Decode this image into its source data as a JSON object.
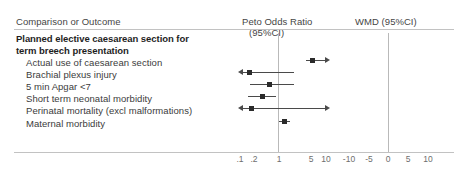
{
  "header": {
    "outcome_col": "Comparison or Outcome",
    "peto_col_line1": "Peto Odds Ratio",
    "peto_col_line2": "(95%CI)",
    "wmd_col": "WMD (95%CI)"
  },
  "group_title_line1": "Planned elective caesarean section for",
  "group_title_line2": "term breech presentation",
  "rows": [
    {
      "label": "Actual use of caesarean section"
    },
    {
      "label": "Brachial plexus injury"
    },
    {
      "label": "5 min Apgar <7"
    },
    {
      "label": "Short term neonatal morbidity"
    },
    {
      "label": "Perinatal mortality (excl malformations)"
    },
    {
      "label": "Maternal morbidity"
    }
  ],
  "axes": {
    "peto": {
      "scale": "log",
      "null_value": "1",
      "ticks": [
        ".1",
        ".2",
        "1",
        "5",
        "10"
      ]
    },
    "wmd": {
      "scale": "linear",
      "null_value": "0",
      "ticks": [
        "-10",
        "-5",
        "0",
        "5",
        "10"
      ]
    }
  },
  "chart_data": {
    "type": "forest",
    "title": "Planned elective caesarean section for term breech presentation",
    "xlabel": "",
    "ylabel": "",
    "effect_measures": [
      "Peto Odds Ratio (95%CI)",
      "WMD (95%CI)"
    ],
    "peto_axis": {
      "scale": "log",
      "ticks": [
        0.1,
        0.2,
        1,
        5,
        10
      ],
      "tick_labels": [
        ".1",
        ".2",
        "1",
        "5",
        "10"
      ],
      "null_line": 1,
      "xlim": [
        0.085,
        13
      ]
    },
    "wmd_axis": {
      "scale": "linear",
      "ticks": [
        -10,
        -5,
        0,
        5,
        10
      ],
      "tick_labels": [
        "-10",
        "-5",
        "0",
        "5",
        "10"
      ],
      "null_line": 0,
      "xlim": [
        -13,
        13
      ]
    },
    "grid": false,
    "legend": "none",
    "categories": [
      "Actual use of caesarean section",
      "Brachial plexus injury",
      "5 min Apgar <7",
      "Short term neonatal morbidity",
      "Perinatal mortality (excl malformations)",
      "Maternal morbidity"
    ],
    "series": [
      {
        "name": "Peto Odds Ratio (95%CI)",
        "points": [
          {
            "category": "Actual use of caesarean section",
            "estimate": 6.6,
            "ci_low": 4.6,
            "ci_high": 11.5,
            "ci_low_truncated": false,
            "ci_high_truncated": true
          },
          {
            "category": "Brachial plexus injury",
            "estimate": 0.2,
            "ci_low": 0.07,
            "ci_high": 2.4,
            "ci_low_truncated": true,
            "ci_high_truncated": false
          },
          {
            "category": "5 min Apgar <7",
            "estimate": 0.6,
            "ci_low": 0.2,
            "ci_high": 2.4,
            "ci_low_truncated": false,
            "ci_high_truncated": false
          },
          {
            "category": "Short term neonatal morbidity",
            "estimate": 0.4,
            "ci_low": 0.18,
            "ci_high": 0.85,
            "ci_low_truncated": false,
            "ci_high_truncated": false
          },
          {
            "category": "Perinatal mortality (excl malformations)",
            "estimate": 0.22,
            "ci_low": 0.07,
            "ci_high": 10.5,
            "ci_low_truncated": true,
            "ci_high_truncated": true
          },
          {
            "category": "Maternal morbidity",
            "estimate": 1.4,
            "ci_low": 1.05,
            "ci_high": 1.95,
            "ci_low_truncated": false,
            "ci_high_truncated": false
          }
        ]
      },
      {
        "name": "WMD (95%CI)",
        "points": []
      }
    ]
  }
}
